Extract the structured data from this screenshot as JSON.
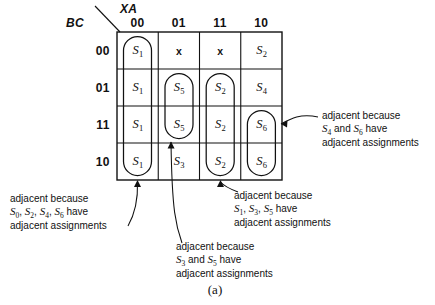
{
  "figure": {
    "caption": "(a)",
    "axis_col_label": "XA",
    "axis_row_label": "BC"
  },
  "kmap": {
    "col_headers": [
      "00",
      "01",
      "11",
      "10"
    ],
    "row_headers": [
      "00",
      "01",
      "11",
      "10"
    ],
    "rows": [
      {
        "header": "00",
        "cells": [
          {
            "text": "S",
            "sub": "1",
            "dontcare": false
          },
          {
            "text": "x",
            "sub": "",
            "dontcare": true
          },
          {
            "text": "x",
            "sub": "",
            "dontcare": true
          },
          {
            "text": "S",
            "sub": "2",
            "dontcare": false
          }
        ]
      },
      {
        "header": "01",
        "cells": [
          {
            "text": "S",
            "sub": "1",
            "dontcare": false
          },
          {
            "text": "S",
            "sub": "5",
            "dontcare": false
          },
          {
            "text": "S",
            "sub": "2",
            "dontcare": false
          },
          {
            "text": "S",
            "sub": "4",
            "dontcare": false
          }
        ]
      },
      {
        "header": "11",
        "cells": [
          {
            "text": "S",
            "sub": "1",
            "dontcare": false
          },
          {
            "text": "S",
            "sub": "5",
            "dontcare": false
          },
          {
            "text": "S",
            "sub": "2",
            "dontcare": false
          },
          {
            "text": "S",
            "sub": "6",
            "dontcare": false
          }
        ]
      },
      {
        "header": "10",
        "cells": [
          {
            "text": "S",
            "sub": "1",
            "dontcare": false
          },
          {
            "text": "S",
            "sub": "3",
            "dontcare": false
          },
          {
            "text": "S",
            "sub": "2",
            "dontcare": false
          },
          {
            "text": "S",
            "sub": "6",
            "dontcare": false
          }
        ]
      }
    ],
    "groups": [
      {
        "name": "group-s1-column",
        "col": 0,
        "row_start": 0,
        "row_end": 3
      },
      {
        "name": "group-s5",
        "col": 1,
        "row_start": 1,
        "row_end": 2
      },
      {
        "name": "group-s2",
        "col": 2,
        "row_start": 1,
        "row_end": 3
      },
      {
        "name": "group-s6",
        "col": 3,
        "row_start": 2,
        "row_end": 3
      }
    ]
  },
  "annotations": {
    "right": {
      "line1": "adjacent because",
      "line2_pre": "",
      "line2_terms": [
        "S4",
        "S6"
      ],
      "line2": "S4 and S6 have",
      "line3": "adjacent assignments"
    },
    "bottom_right": {
      "line1": "adjacent because",
      "line2": "S1, S3, S5 have",
      "line3": "adjacent assignments"
    },
    "bottom_center": {
      "line1": "adjacent because",
      "line2": "S3 and S5 have",
      "line3": "adjacent assignments"
    },
    "bottom_left": {
      "line1": "adjacent because",
      "line2": "S0, S2, S4, S6 have",
      "line3": "adjacent assignments"
    }
  },
  "colors": {
    "ink": "#111111",
    "background": "#ffffff"
  }
}
